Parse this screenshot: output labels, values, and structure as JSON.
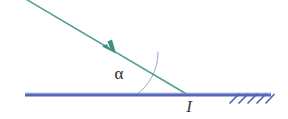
{
  "figure": {
    "type": "optics-ray-diagram",
    "background_color": "#ffffff",
    "width": 288,
    "height": 119,
    "labels": {
      "angle": "α",
      "point": "I"
    },
    "colors": {
      "ray": "#4a9b91",
      "surface": "#5566bb",
      "arc": "#8fa4d6",
      "hatch": "#5566bb",
      "text": "#2b2b2b"
    },
    "elements": {
      "incident_ray": {
        "name": "incident-ray",
        "start": [
          24,
          0
        ],
        "end": [
          188,
          95
        ],
        "arrow_at": [
          112,
          50
        ],
        "stroke_width": 1.4
      },
      "surface_line": {
        "name": "surface-line",
        "start": [
          25,
          95
        ],
        "end": [
          271,
          95
        ],
        "stroke_width": 3
      },
      "angle_arc": {
        "name": "angle-arc",
        "vertex": [
          188,
          95
        ],
        "radius": 52,
        "stroke_width": 1
      },
      "hatching": {
        "name": "surface-hatching",
        "count": 5,
        "x_start": 232,
        "spacing": 9,
        "length": 11,
        "stroke_width": 1.6
      }
    }
  }
}
